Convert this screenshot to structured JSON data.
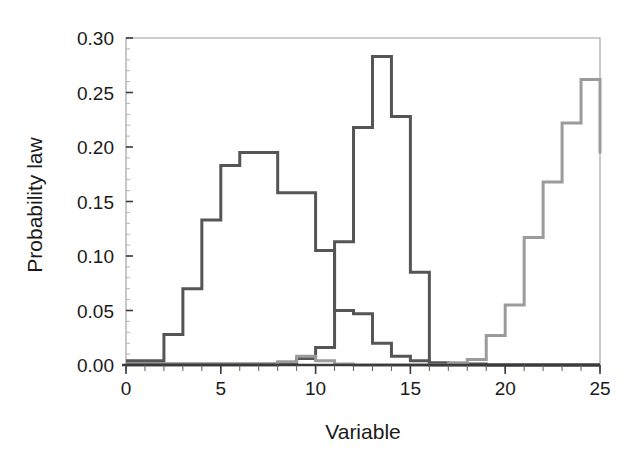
{
  "chart_data": {
    "type": "line",
    "title": "",
    "xlabel": "Variable",
    "ylabel": "Probability law",
    "xlim": [
      0,
      25
    ],
    "ylim": [
      0.0,
      0.3
    ],
    "grid": false,
    "legend": "none",
    "xticks": [
      0,
      5,
      10,
      15,
      20,
      25
    ],
    "xtick_labels": [
      "0",
      "5",
      "10",
      "15",
      "20",
      "25"
    ],
    "xtick_minor_step": 1,
    "yticks": [
      0.0,
      0.05,
      0.1,
      0.15,
      0.2,
      0.25,
      0.3
    ],
    "ytick_labels": [
      "0.00",
      "0.05",
      "0.10",
      "0.15",
      "0.20",
      "0.25",
      "0.30"
    ],
    "ytick_minor_step": 0.01,
    "drawstyle": "steps-post",
    "bin_width": 1,
    "series": [
      {
        "name": "distribution-1",
        "color": "#555555",
        "linewidth": 3.0,
        "x": [
          0,
          1,
          2,
          3,
          4,
          5,
          6,
          7,
          8,
          9,
          10,
          11,
          12,
          13,
          14,
          15,
          16,
          17,
          18,
          19,
          20,
          21,
          22,
          23,
          24,
          25
        ],
        "values": [
          0.004,
          0.004,
          0.028,
          0.07,
          0.133,
          0.183,
          0.195,
          0.195,
          0.158,
          0.158,
          0.105,
          0.05,
          0.047,
          0.02,
          0.008,
          0.004,
          0.002,
          0.001,
          0.001,
          0.0,
          0.0,
          0.0,
          0.0,
          0.0,
          0.0,
          0.0
        ]
      },
      {
        "name": "distribution-2",
        "color": "#555555",
        "linewidth": 3.0,
        "x": [
          0,
          1,
          2,
          3,
          4,
          5,
          6,
          7,
          8,
          9,
          10,
          11,
          12,
          13,
          14,
          15,
          16,
          17,
          18,
          19,
          20,
          21,
          22,
          23,
          24,
          25
        ],
        "values": [
          0.001,
          0.001,
          0.001,
          0.001,
          0.001,
          0.001,
          0.001,
          0.001,
          0.002,
          0.006,
          0.016,
          0.113,
          0.218,
          0.283,
          0.228,
          0.085,
          0.0,
          0.0,
          0.0,
          0.0,
          0.0,
          0.0,
          0.0,
          0.0,
          0.0,
          0.0
        ]
      },
      {
        "name": "distribution-3",
        "color": "#9b9b9b",
        "linewidth": 3.0,
        "x": [
          0,
          1,
          2,
          3,
          4,
          5,
          6,
          7,
          8,
          9,
          10,
          11,
          12,
          13,
          14,
          15,
          16,
          17,
          18,
          19,
          20,
          21,
          22,
          23,
          24,
          25
        ],
        "values": [
          0.0,
          0.0,
          0.0,
          0.0,
          0.0,
          0.0,
          0.0,
          0.0,
          0.003,
          0.008,
          0.004,
          0.001,
          0.0,
          0.0,
          0.0,
          0.0,
          0.0,
          0.002,
          0.005,
          0.027,
          0.055,
          0.117,
          0.168,
          0.222,
          0.262,
          0.194
        ]
      }
    ]
  },
  "axes": {
    "x_title": "Variable",
    "y_title": "Probability law"
  }
}
